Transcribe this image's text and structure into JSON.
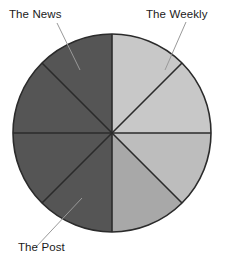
{
  "figure": {
    "background_color": "#ffffff",
    "width": 237,
    "height": 250
  },
  "labels": {
    "news": "The News",
    "weekly": "The Weekly",
    "bottom": "The Post"
  },
  "chart_data": {
    "type": "pie",
    "title": "",
    "subtitle": "",
    "xlabel": "",
    "ylabel": "",
    "grid": false,
    "legend": "none",
    "annotations": [
      {
        "text": "The News",
        "target_slice": 1,
        "leader_from": [
          57,
          23
        ],
        "leader_to": [
          80,
          70
        ]
      },
      {
        "text": "The Weekly",
        "target_slice": 7,
        "leader_from": [
          186,
          22
        ],
        "leader_to": [
          165,
          70
        ]
      },
      {
        "text": "The Post",
        "target_slice": 4,
        "leader_from": [
          36,
          247
        ],
        "leader_to": [
          82,
          198
        ],
        "clipped": true
      }
    ],
    "center": [
      112,
      133
    ],
    "radius": 99,
    "slice_count": 8,
    "slice_angle_degrees": 45,
    "outline_color": "#2b2b2b",
    "categories": [
      "Slice 1",
      "Slice 2",
      "Slice 3",
      "Slice 4",
      "Slice 5",
      "Slice 6",
      "Slice 7",
      "Slice 8"
    ],
    "values": [
      12.5,
      12.5,
      12.5,
      12.5,
      12.5,
      12.5,
      12.5,
      12.5
    ],
    "slices": [
      {
        "name": "Slice 1",
        "value": 12.5,
        "start_angle": 270,
        "end_angle": 315,
        "color": "#c8c8c8"
      },
      {
        "name": "Slice 2",
        "value": 12.5,
        "start_angle": 315,
        "end_angle": 360,
        "color": "#c8c8c8"
      },
      {
        "name": "Slice 3",
        "value": 12.5,
        "start_angle": 0,
        "end_angle": 45,
        "color": "#bdbdbd"
      },
      {
        "name": "Slice 4",
        "value": 12.5,
        "start_angle": 45,
        "end_angle": 90,
        "color": "#a8a8a8"
      },
      {
        "name": "Slice 5",
        "value": 12.5,
        "start_angle": 90,
        "end_angle": 135,
        "color": "#555555"
      },
      {
        "name": "Slice 6",
        "value": 12.5,
        "start_angle": 135,
        "end_angle": 180,
        "color": "#555555"
      },
      {
        "name": "Slice 7",
        "value": 12.5,
        "start_angle": 180,
        "end_angle": 225,
        "color": "#555555"
      },
      {
        "name": "Slice 8",
        "value": 12.5,
        "start_angle": 225,
        "end_angle": 270,
        "color": "#555555"
      }
    ],
    "leader_line_color": "#999999"
  }
}
